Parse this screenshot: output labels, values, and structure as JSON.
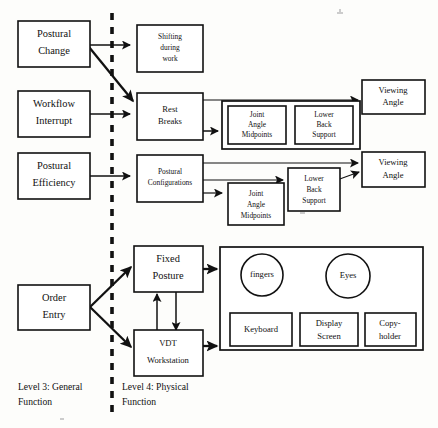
{
  "figure": {
    "type": "abstraction-hierarchy-diagram",
    "background_color": "#fdfdfb",
    "stroke_color": "#111111"
  },
  "legend": {
    "level3": {
      "line1": "Level 3:  General",
      "line2": "Function"
    },
    "level4": {
      "line1": "Level 4:  Physical",
      "line2": "Function"
    },
    "divider_name": "level-divider-dashed-line"
  },
  "nodes": {
    "postural_change": {
      "line1": "Postural",
      "line2": "Change"
    },
    "workflow_interrupt": {
      "line1": "Workflow",
      "line2": "Interrupt"
    },
    "postural_efficiency": {
      "line1": "Postural",
      "line2": "Efficiency"
    },
    "order_entry": {
      "line1": "Order",
      "line2": "Entry"
    },
    "shifting_during_work": {
      "line1": "Shifting",
      "line2": "during",
      "line3": "work"
    },
    "rest_breaks": {
      "line1": "Rest",
      "line2": "Breaks"
    },
    "postural_configurations": {
      "line1": "Postural",
      "line2": "Configurations"
    },
    "fixed_posture": {
      "line1": "Fixed",
      "line2": "Posture"
    },
    "vdt_workstation": {
      "line1": "VDT",
      "line2": "Workstation"
    },
    "joint_angle_midpoints_top": {
      "line1": "Joint",
      "line2": "Angle",
      "line3": "Midpoints"
    },
    "lower_back_support_top": {
      "line1": "Lower",
      "line2": "Back",
      "line3": "Support"
    },
    "joint_angle_midpoints_bottom": {
      "line1": "Joint",
      "line2": "Angle",
      "line3": "Midpoints"
    },
    "lower_back_support_bottom": {
      "line1": "Lower",
      "line2": "Back",
      "line3": "Support"
    },
    "viewing_angle_top": {
      "line1": "Viewing",
      "line2": "Angle"
    },
    "viewing_angle_bottom": {
      "line1": "Viewing",
      "line2": "Angle"
    },
    "fingers": {
      "label": "fingers"
    },
    "eyes": {
      "label": "Eyes"
    },
    "keyboard": {
      "label": "Keyboard"
    },
    "display_screen": {
      "line1": "Display",
      "line2": "Screen"
    },
    "copyholder": {
      "line1": "Copy-",
      "line2": "holder"
    }
  }
}
